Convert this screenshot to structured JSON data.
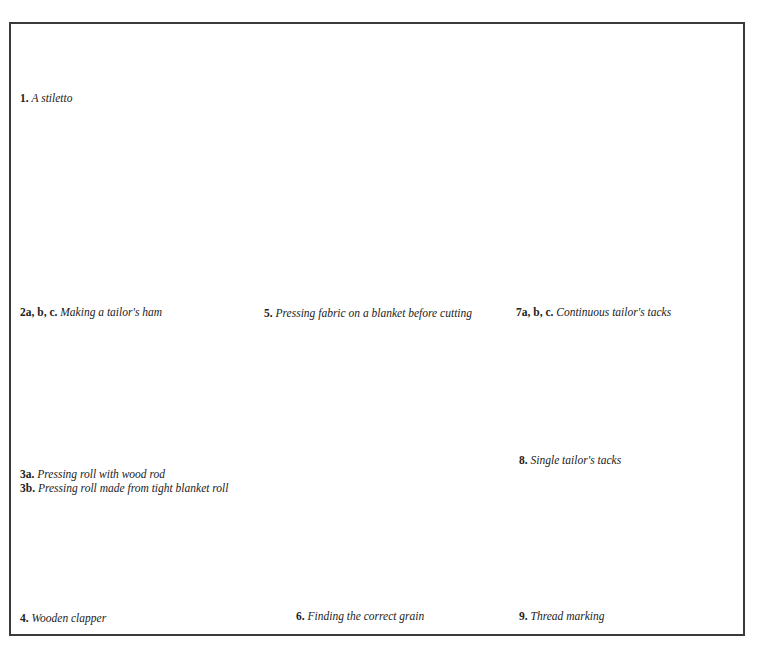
{
  "figure": {
    "colors": {
      "gray_light": "#b3b3b3",
      "gray_mid": "#8f8f8f",
      "gray_dark": "#7a7a7a",
      "ink": "#1a1a1a",
      "blanket": "#d6d6d6"
    },
    "panels": [
      {
        "id": "1",
        "num": "1.",
        "caption": "A stiletto"
      },
      {
        "id": "2",
        "num": "2a, b, c.",
        "caption": "Making a tailor's ham",
        "labels": {
          "a": "a",
          "b": "b",
          "c": "c",
          "height": "8\"",
          "width": "12\""
        }
      },
      {
        "id": "3",
        "num_a": "3a.",
        "caption_a": "Pressing roll with wood rod",
        "num_b": "3b.",
        "caption_b": "Pressing roll made from tight blanket roll",
        "labels": {
          "a": "a",
          "b": "b",
          "length": "approx. 12\""
        }
      },
      {
        "id": "4",
        "num": "4.",
        "caption": "Wooden clapper"
      },
      {
        "id": "5",
        "num": "5.",
        "caption": "Pressing fabric on a blanket before cutting",
        "labels": {
          "blanket": "BLANKET",
          "fabric": "WRONG SIDE OF FABRIC",
          "iron": "DRY IRON",
          "cloth": "DAMPENED CLOTH"
        }
      },
      {
        "id": "6",
        "num": "6.",
        "caption": "Finding the correct grain",
        "labels": {
          "x1": "X\"",
          "x2": "X\"",
          "seam1": "1\" seam allowance",
          "seam2": "for adjustments",
          "fold": "FOLD",
          "selvedges": "SELVEDGES",
          "y1": "Y\"",
          "y2": "Y\""
        }
      },
      {
        "id": "7",
        "num": "7a, b, c.",
        "caption": "Continuous tailor's tacks",
        "labels": {
          "a": "a",
          "b": "b",
          "c": "c",
          "pattern": "PATTERN",
          "snip_b": "snip",
          "snip_c": "snip"
        }
      },
      {
        "id": "8",
        "num": "8.",
        "caption": "Single tailor's tacks",
        "labels": {
          "pattern": "PATTERN",
          "snip1": "snip",
          "snip2": "snip"
        }
      },
      {
        "id": "9",
        "num": "9.",
        "caption": "Thread marking",
        "labels": {
          "fold": "CENTRE BACK FOLD"
        }
      }
    ]
  }
}
